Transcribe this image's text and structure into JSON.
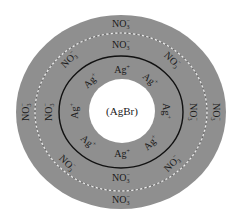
{
  "diagram": {
    "title": "",
    "colors": {
      "background": "#ffffff",
      "outer_layer": "#8f8f8f",
      "dashed_boundary": "#e8e8e8",
      "solid_boundary": "#111111",
      "core": "#ffffff",
      "text": "#1a1a1a"
    },
    "core": {
      "label": "(AgBr)"
    },
    "primary_layer": {
      "ion": "Ag",
      "charge": "+",
      "count": 8
    },
    "counter_layer_inner": {
      "ion": "NO",
      "subscript": "3",
      "charge": "−",
      "count": 8
    },
    "counter_layer_outer": {
      "ion": "NO",
      "subscript": "3",
      "charge": "−",
      "count": 4
    }
  }
}
